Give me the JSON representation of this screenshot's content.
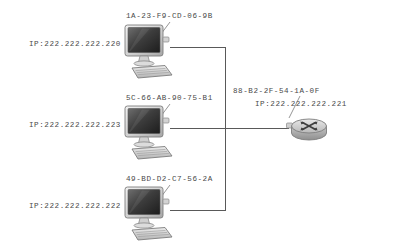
{
  "diagram": {
    "background_color": "#ffffff",
    "line_color": "#595959",
    "text_color": "#4a4a4a"
  },
  "hosts": [
    {
      "id": "host-1",
      "icon": "desktop-computer-icon",
      "mac": "1A-23-F9-CD-06-9B",
      "ip": "IP:222.222.222.220"
    },
    {
      "id": "host-2",
      "icon": "desktop-computer-icon",
      "mac": "5C-66-AB-90-75-B1",
      "ip": "IP:222.222.222.223"
    },
    {
      "id": "host-3",
      "icon": "desktop-computer-icon",
      "mac": "49-BD-D2-C7-56-2A",
      "ip": "IP:222.222.222.222"
    }
  ],
  "router": {
    "id": "router-1",
    "icon": "router-icon",
    "mac": "88-B2-2F-54-1A-0F",
    "ip": "IP:222.222.222.221"
  }
}
